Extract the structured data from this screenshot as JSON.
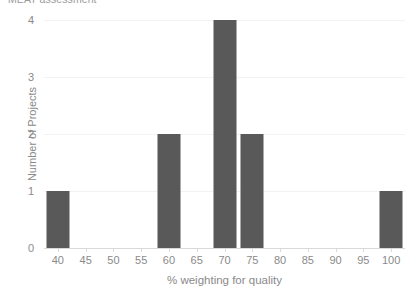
{
  "chart_data": {
    "type": "bar",
    "title": "MEAT assessment",
    "xlabel": "% weighting for quality",
    "ylabel": "Number of Projects",
    "categories": [
      40,
      45,
      50,
      55,
      60,
      65,
      70,
      75,
      80,
      85,
      90,
      95,
      100
    ],
    "values": [
      1,
      0,
      0,
      0,
      2,
      0,
      4,
      2,
      0,
      0,
      0,
      0,
      1
    ],
    "bars": [
      {
        "x": 40,
        "value": 1
      },
      {
        "x": 60,
        "value": 2
      },
      {
        "x": 70,
        "value": 4
      },
      {
        "x": 75,
        "value": 2
      },
      {
        "x": 100,
        "value": 1
      }
    ],
    "xlim": [
      37.5,
      102.5
    ],
    "ylim": [
      0,
      4
    ],
    "xticks": [
      "40",
      "45",
      "50",
      "55",
      "60",
      "65",
      "70",
      "75",
      "80",
      "85",
      "90",
      "95",
      "100"
    ],
    "yticks": [
      "0",
      "1",
      "2",
      "3",
      "4"
    ],
    "grid": true,
    "legend": false,
    "colors": {
      "bar": "#595959",
      "gridline": "#f2f2f2",
      "axis": "#d9d9d9",
      "tick_label": "#8a8a8a",
      "axis_title": "#8a8a8a",
      "title": "#9a9a9a",
      "background": "#ffffff"
    }
  }
}
